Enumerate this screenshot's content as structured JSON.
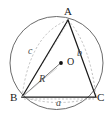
{
  "figure": {
    "vertices": [
      {
        "id": "A",
        "label": "A",
        "x": 68,
        "y": 20
      },
      {
        "id": "B",
        "label": "B",
        "x": 22,
        "y": 97
      },
      {
        "id": "C",
        "label": "C",
        "x": 96,
        "y": 97
      }
    ],
    "center": {
      "id": "O",
      "label": "O",
      "x": 61,
      "y": 63,
      "dot_radius": 1.8
    },
    "circle": {
      "cx": 56.5,
      "cy": 63,
      "r": 46.5
    },
    "sides": [
      {
        "id": "a",
        "label": "a",
        "from": "B",
        "to": "C",
        "style": "dashed"
      },
      {
        "id": "b",
        "label": "b",
        "from": "A",
        "to": "C",
        "style": "dashed-arc"
      },
      {
        "id": "c",
        "label": "c",
        "from": "A",
        "to": "B",
        "style": "dashed-arc"
      }
    ],
    "radius": {
      "id": "R",
      "label": "R",
      "from": "B",
      "to": "O",
      "style": "solid-thin"
    },
    "colors": {
      "stroke_triangle": "#1a1a1a",
      "stroke_circle": "#5a5a5a",
      "stroke_dashed": "#9a9a9a",
      "stroke_radius": "#6a6a6a",
      "background": "#ffffff",
      "text": "#1a1a1a"
    }
  }
}
